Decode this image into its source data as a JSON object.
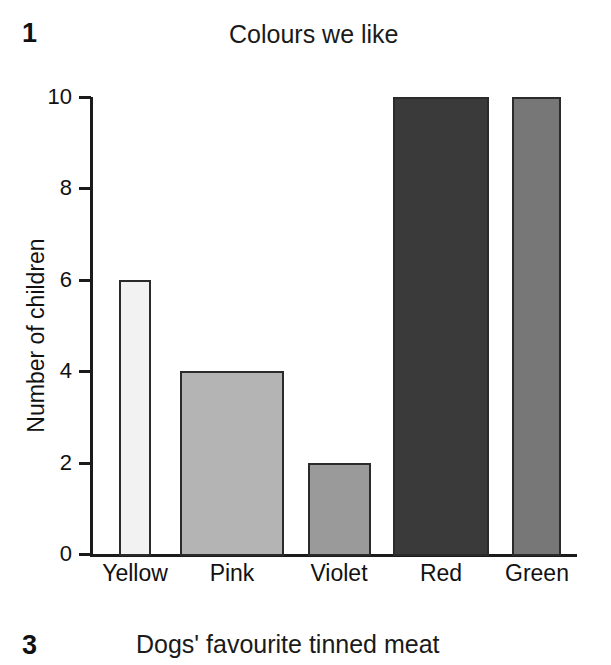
{
  "figures": [
    {
      "number": "1",
      "title": "Colours we like"
    },
    {
      "number": "3",
      "title": "Dogs' favourite tinned meat"
    }
  ],
  "chart_data": {
    "type": "bar",
    "title": "Colours we like",
    "xlabel": "",
    "ylabel": "Number of children",
    "categories": [
      "Yellow",
      "Pink",
      "Violet",
      "Red",
      "Green"
    ],
    "values": [
      6,
      4,
      2,
      10,
      10
    ],
    "ylim": [
      0,
      10
    ],
    "yticks": [
      0,
      2,
      4,
      6,
      8,
      10
    ],
    "ytick_labels": [
      "0",
      "2",
      "4",
      "6",
      "8",
      "10"
    ],
    "grid": false,
    "legend": "none",
    "bar_colors": [
      "#f2f2f2",
      "#b4b4b4",
      "#9a9a9a",
      "#3a3a3a",
      "#777777"
    ],
    "bar_edge_color": "#2b2b2b",
    "bar_geometry": [
      {
        "label": "Yellow",
        "left": 119,
        "width": 32
      },
      {
        "label": "Pink",
        "left": 180,
        "width": 104
      },
      {
        "label": "Violet",
        "left": 308,
        "width": 63
      },
      {
        "label": "Red",
        "left": 393,
        "width": 96
      },
      {
        "label": "Green",
        "left": 512,
        "width": 49
      }
    ],
    "tick_label_positions": [
      {
        "label": "Yellow",
        "center": 135
      },
      {
        "label": "Pink",
        "center": 232
      },
      {
        "label": "Violet",
        "center": 339
      },
      {
        "label": "Red",
        "center": 441
      },
      {
        "label": "Green",
        "center": 537
      }
    ]
  }
}
